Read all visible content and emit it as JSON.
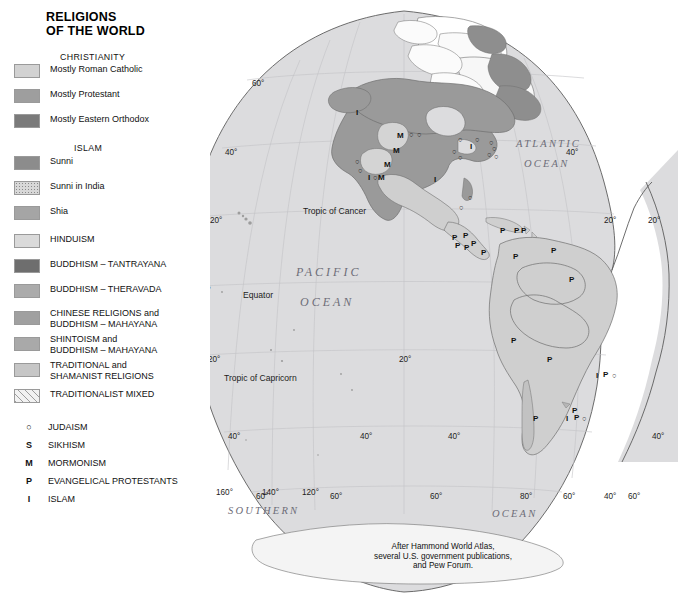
{
  "title": "RELIGIONS\nOF THE WORLD",
  "legend": {
    "headings": [
      {
        "text": "CHRISTIANITY"
      },
      {
        "text": "ISLAM"
      }
    ],
    "swatches": [
      {
        "id": "catholic",
        "label": "Mostly Roman Catholic",
        "color": "#d2d2d2"
      },
      {
        "id": "protestant",
        "label": "Mostly Protestant",
        "color": "#9e9e9e"
      },
      {
        "id": "orthodox",
        "label": "Mostly Eastern Orthodox",
        "color": "#7a7a7a"
      },
      {
        "id": "sunni",
        "label": "Sunni",
        "color": "#8c8c8c"
      },
      {
        "id": "sunni-india",
        "label": "Sunni in India",
        "color": "#d8d8d8"
      },
      {
        "id": "shia",
        "label": "Shia",
        "color": "#a5a5a5"
      },
      {
        "id": "hinduism",
        "label": "HINDUISM",
        "color": "#dadada"
      },
      {
        "id": "tantrayana",
        "label": "BUDDHISM – TANTRAYANA",
        "color": "#6e6e6e"
      },
      {
        "id": "theravada",
        "label": "BUDDHISM – THERAVADA",
        "color": "#ababab"
      },
      {
        "id": "chinese",
        "label": "CHINESE RELIGIONS and\nBUDDHISM – MAHAYANA",
        "color": "#a0a0a0"
      },
      {
        "id": "shinto",
        "label": "SHINTOISM and\nBUDDHISM – MAHAYANA",
        "color": "#a9a9a9"
      },
      {
        "id": "traditional",
        "label": "TRADITIONAL and\nSHAMANIST RELIGIONS",
        "color": "#c6c6c6"
      },
      {
        "id": "tradmixed",
        "label": "TRADITIONALIST MIXED",
        "color": "#f2f2f2"
      }
    ],
    "symbols": [
      {
        "glyph": "○",
        "label": "JUDAISM"
      },
      {
        "glyph": "S",
        "label": "SIKHISM"
      },
      {
        "glyph": "M",
        "label": "MORMONISM"
      },
      {
        "glyph": "P",
        "label": "EVANGELICAL PROTESTANTS"
      },
      {
        "glyph": "I",
        "label": "ISLAM"
      }
    ]
  },
  "scale": {
    "km_labels": [
      "0",
      "1000",
      "2000",
      "3000 Kilometers"
    ],
    "mi_labels": [
      "0",
      "1000",
      "2000 Miles"
    ]
  },
  "credit": "After Hammond World Atlas,\nseveral U.S. government publications,\nand Pew Forum.",
  "map": {
    "ocean_names": [
      {
        "text": "PACIFIC",
        "x": 296,
        "y": 265,
        "size": "lg"
      },
      {
        "text": "OCEAN",
        "x": 300,
        "y": 295,
        "size": "lg"
      },
      {
        "text": "ATLANTIC",
        "x": 516,
        "y": 138,
        "size": "sm"
      },
      {
        "text": "OCEAN",
        "x": 524,
        "y": 158,
        "size": "sm"
      },
      {
        "text": "SOUTHERN",
        "x": 228,
        "y": 505,
        "size": "sm"
      },
      {
        "text": "OCEAN",
        "x": 492,
        "y": 508,
        "size": "sm"
      }
    ],
    "guides": [
      {
        "text": "Tropic of Cancer",
        "x": 303,
        "y": 206
      },
      {
        "text": "Equator",
        "x": 243,
        "y": 290
      },
      {
        "text": "Tropic of Capricorn",
        "x": 224,
        "y": 373
      }
    ],
    "latitudes": [
      {
        "text": "60°",
        "x": 252,
        "y": 79
      },
      {
        "text": "40°",
        "x": 225,
        "y": 148
      },
      {
        "text": "20°",
        "x": 210,
        "y": 216
      },
      {
        "text": "0°",
        "x": 203,
        "y": 286
      },
      {
        "text": "20°",
        "x": 208,
        "y": 355
      },
      {
        "text": "40°",
        "x": 228,
        "y": 432
      },
      {
        "text": "60°",
        "x": 256,
        "y": 492
      },
      {
        "text": "40°",
        "x": 566,
        "y": 148
      },
      {
        "text": "20°",
        "x": 604,
        "y": 216
      },
      {
        "text": "20°",
        "x": 648,
        "y": 216
      },
      {
        "text": "20°",
        "x": 399,
        "y": 355
      },
      {
        "text": "40°",
        "x": 360,
        "y": 432
      },
      {
        "text": "40°",
        "x": 448,
        "y": 432
      },
      {
        "text": "40°",
        "x": 652,
        "y": 432
      },
      {
        "text": "60°",
        "x": 330,
        "y": 492
      },
      {
        "text": "60°",
        "x": 430,
        "y": 492
      },
      {
        "text": "60°",
        "x": 628,
        "y": 492
      }
    ],
    "longitudes": [
      {
        "text": "160°",
        "x": 216,
        "y": 488
      },
      {
        "text": "140°",
        "x": 262,
        "y": 488
      },
      {
        "text": "120°",
        "x": 302,
        "y": 488
      },
      {
        "text": "80°",
        "x": 520,
        "y": 492
      },
      {
        "text": "60°",
        "x": 563,
        "y": 492
      },
      {
        "text": "40°",
        "x": 604,
        "y": 492
      }
    ],
    "markers": [
      {
        "glyph": "M",
        "x": 397,
        "y": 131
      },
      {
        "glyph": "M",
        "x": 393,
        "y": 146
      },
      {
        "glyph": "M",
        "x": 384,
        "y": 160
      },
      {
        "glyph": "M",
        "x": 378,
        "y": 173
      },
      {
        "glyph": "I",
        "x": 368,
        "y": 173
      },
      {
        "glyph": "I",
        "x": 434,
        "y": 175
      },
      {
        "glyph": "I",
        "x": 470,
        "y": 142
      },
      {
        "glyph": "I",
        "x": 356,
        "y": 108
      },
      {
        "glyph": "○",
        "x": 409,
        "y": 130
      },
      {
        "glyph": "○",
        "x": 417,
        "y": 130
      },
      {
        "glyph": "○",
        "x": 458,
        "y": 135
      },
      {
        "glyph": "○",
        "x": 475,
        "y": 135
      },
      {
        "glyph": "○",
        "x": 489,
        "y": 138
      },
      {
        "glyph": "○",
        "x": 492,
        "y": 144
      },
      {
        "glyph": "○",
        "x": 487,
        "y": 150
      },
      {
        "glyph": "○",
        "x": 452,
        "y": 147
      },
      {
        "glyph": "○",
        "x": 458,
        "y": 153
      },
      {
        "glyph": "○",
        "x": 494,
        "y": 152
      },
      {
        "glyph": "○",
        "x": 355,
        "y": 157
      },
      {
        "glyph": "○",
        "x": 358,
        "y": 166
      },
      {
        "glyph": "○",
        "x": 373,
        "y": 173
      },
      {
        "glyph": "○",
        "x": 468,
        "y": 193
      },
      {
        "glyph": "○",
        "x": 459,
        "y": 203
      },
      {
        "glyph": "M",
        "x": 190,
        "y": 339
      },
      {
        "glyph": "M",
        "x": 182,
        "y": 363
      },
      {
        "glyph": "P",
        "x": 452,
        "y": 233
      },
      {
        "glyph": "P",
        "x": 455,
        "y": 241
      },
      {
        "glyph": "P",
        "x": 463,
        "y": 231
      },
      {
        "glyph": "P",
        "x": 464,
        "y": 243
      },
      {
        "glyph": "P",
        "x": 471,
        "y": 239
      },
      {
        "glyph": "P",
        "x": 481,
        "y": 248
      },
      {
        "glyph": "P",
        "x": 500,
        "y": 226
      },
      {
        "glyph": "P",
        "x": 514,
        "y": 226
      },
      {
        "glyph": "P",
        "x": 521,
        "y": 226
      },
      {
        "glyph": "P",
        "x": 551,
        "y": 246
      },
      {
        "glyph": "P",
        "x": 569,
        "y": 275
      },
      {
        "glyph": "P",
        "x": 513,
        "y": 252
      },
      {
        "glyph": "P",
        "x": 511,
        "y": 336
      },
      {
        "glyph": "P",
        "x": 547,
        "y": 355
      },
      {
        "glyph": "P",
        "x": 603,
        "y": 370
      },
      {
        "glyph": "I",
        "x": 596,
        "y": 371
      },
      {
        "glyph": "○",
        "x": 612,
        "y": 371
      },
      {
        "glyph": "P",
        "x": 572,
        "y": 406
      },
      {
        "glyph": "P",
        "x": 574,
        "y": 413
      },
      {
        "glyph": "I",
        "x": 566,
        "y": 414
      },
      {
        "glyph": "○",
        "x": 582,
        "y": 414
      },
      {
        "glyph": "P",
        "x": 533,
        "y": 414
      }
    ]
  }
}
